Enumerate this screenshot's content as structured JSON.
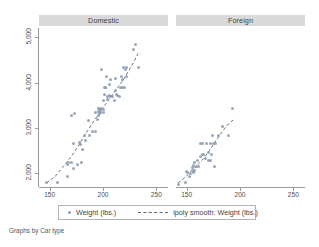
{
  "chart_data": {
    "type": "scatter",
    "title": "",
    "subtitle": "",
    "caption": "Graphs by Car type",
    "xlabel": "",
    "ylabel": "",
    "grid": false,
    "legend_position": "bottom",
    "xlim": [
      140,
      260
    ],
    "ylim": [
      1700,
      5200
    ],
    "xticks": [
      150,
      200,
      250
    ],
    "xtick_labels": [
      "150",
      "200",
      "250"
    ],
    "yticks": [
      2000,
      3000,
      4000,
      5000
    ],
    "ytick_labels": [
      "2,000",
      "3,000",
      "4,000",
      "5,000"
    ],
    "legend": [
      {
        "label": "Weight (lbs.)",
        "marker": "circle",
        "color": "#8f9fb4"
      },
      {
        "label": "lpoly smooth: Weight (lbs.)",
        "marker": "dashed-line",
        "color": "#5a6472"
      }
    ],
    "panels": [
      {
        "name": "Domestic",
        "series": [
          {
            "name": "Weight (lbs.)",
            "type": "scatter",
            "x": [
              147,
              157,
              167,
              167,
              168,
              170,
              170,
              172,
              172,
              173,
              176,
              178,
              179,
              180,
              181,
              183,
              184,
              186,
              187,
              190,
              193,
              193,
              195,
              196,
              196,
              196,
              197,
              197,
              197,
              198,
              198,
              199,
              199,
              200,
              200,
              200,
              201,
              201,
              202,
              202,
              203,
              204,
              204,
              206,
              206,
              207,
              207,
              209,
              211,
              212,
              212,
              213,
              214,
              215,
              216,
              217,
              218,
              218,
              219,
              220,
              221,
              222,
              222,
              229,
              230,
              233
            ],
            "y": [
              1800,
              1800,
              1930,
              2200,
              2240,
              2230,
              3280,
              2110,
              2650,
              3310,
              2200,
              2670,
              2640,
              2230,
              2520,
              2830,
              2730,
              3170,
              2830,
              2930,
              2930,
              3350,
              3180,
              3280,
              3420,
              3370,
              3350,
              3420,
              3310,
              3350,
              3380,
              3420,
              4290,
              3400,
              3600,
              3330,
              3740,
              3900,
              3880,
              3900,
              4130,
              3700,
              3620,
              3720,
              3950,
              4060,
              3690,
              3690,
              3600,
              3830,
              4080,
              3740,
              3720,
              3690,
              3880,
              4130,
              4060,
              3900,
              4330,
              3900,
              4290,
              4130,
              4330,
              4720,
              4840,
              4330
            ]
          },
          {
            "name": "lpoly smooth: Weight (lbs.)",
            "type": "line",
            "x": [
              147,
              155,
              162,
              170,
              177,
              184,
              191,
              198,
              205,
              212,
              219,
              226,
              233
            ],
            "y": [
              1790,
              1930,
              2130,
              2360,
              2610,
              2880,
              3140,
              3370,
              3610,
              3830,
              4060,
              4330,
              4640
            ]
          }
        ]
      },
      {
        "name": "Foreign",
        "series": [
          {
            "name": "Weight (lbs.)",
            "type": "scatter",
            "x": [
              142,
              149,
              150,
              151,
              153,
              154,
              155,
              155,
              156,
              156,
              157,
              157,
              159,
              160,
              161,
              163,
              163,
              165,
              165,
              166,
              168,
              169,
              170,
              170,
              172,
              172,
              173,
              174,
              175,
              176,
              177,
              180,
              184,
              189,
              193
            ],
            "y": [
              1760,
              1800,
              2050,
              2020,
              1930,
              1990,
              2070,
              2130,
              2020,
              2180,
              2070,
              2240,
              2160,
              2280,
              2160,
              2370,
              2650,
              2410,
              2650,
              2410,
              2330,
              2650,
              2280,
              2460,
              2280,
              2650,
              2410,
              2830,
              2650,
              2160,
              2650,
              2830,
              3040,
              2830,
              3420
            ]
          },
          {
            "name": "lpoly smooth: Weight (lbs.)",
            "type": "line",
            "x": [
              142,
              148,
              154,
              160,
              166,
              172,
              178,
              184,
              190,
              194
            ],
            "y": [
              1790,
              1900,
              2040,
              2180,
              2330,
              2520,
              2740,
              2940,
              3110,
              3180
            ]
          }
        ]
      }
    ]
  },
  "panel_headers": [
    {
      "label": "Domestic"
    },
    {
      "label": "Foreign"
    }
  ],
  "axes": {
    "y_tick_labels": [
      "5,000",
      "4,000",
      "3,000",
      "2,000"
    ],
    "x_tick_labels_left": [
      "150",
      "200",
      "250"
    ],
    "x_tick_labels_right": [
      "150",
      "200",
      "250"
    ]
  },
  "legend": {
    "marker_label": "Weight (lbs.)",
    "line_label": "lpoly smooth: Weight (lbs.)"
  },
  "caption": {
    "text": "Graphs by Car type"
  },
  "colors": {
    "marker": "#8f9fb4",
    "line": "#5a6472",
    "header_bg": "#d9d9d9",
    "axis": "#9a9a9a",
    "text": "#4d4d4d",
    "background": "#ffffff"
  }
}
